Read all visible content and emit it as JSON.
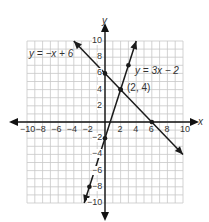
{
  "chart_data": {
    "type": "line",
    "title": "",
    "xlabel": "x",
    "ylabel": "y",
    "xlim": [
      -10,
      10
    ],
    "ylim": [
      -10,
      10
    ],
    "grid": true,
    "x_ticks": [
      -10,
      -8,
      -6,
      -4,
      -2,
      2,
      4,
      6,
      8,
      10
    ],
    "y_ticks": [
      10,
      8,
      6,
      4,
      2,
      -2,
      -4,
      -6,
      -8,
      -10
    ],
    "x_tick_labels": [
      "−10",
      "−8",
      "−6",
      "−4",
      "−2",
      "2",
      "4",
      "6",
      "8",
      "10"
    ],
    "y_tick_labels": [
      "10",
      "8",
      "6",
      "4",
      "2",
      "−2",
      "−4",
      "−6",
      "−8",
      "−10"
    ],
    "series": [
      {
        "name": "y = −x + 6",
        "equation": "y = -x + 6",
        "slope": -1,
        "intercept": 6,
        "segment": [
          [
            -4,
            10
          ],
          [
            10,
            -4
          ]
        ],
        "points": [
          [
            0,
            6
          ],
          [
            2,
            4
          ],
          [
            6,
            0
          ]
        ]
      },
      {
        "name": "y = 3x − 2",
        "equation": "y = 3x - 2",
        "slope": 3,
        "intercept": -2,
        "segment": [
          [
            -2.67,
            -10
          ],
          [
            4,
            10
          ]
        ],
        "points": [
          [
            3,
            7
          ],
          [
            2,
            4
          ],
          [
            0,
            -2
          ],
          [
            -2,
            -8
          ]
        ]
      }
    ],
    "annotations": [
      {
        "text": "(2, 4)",
        "x": 2,
        "y": 4,
        "note": "intersection point"
      }
    ],
    "legend": "none (inline equation labels)"
  },
  "labels": {
    "x_axis": "x",
    "y_axis": "y",
    "eq1": "y = −x + 6",
    "eq2": "y = 3x − 2",
    "intersection": "(2, 4)"
  },
  "colors": {
    "grid": "#c8c8c8",
    "axis": "#111111",
    "line": "#1a1a1a",
    "text": "#333333",
    "background": "#ffffff"
  }
}
